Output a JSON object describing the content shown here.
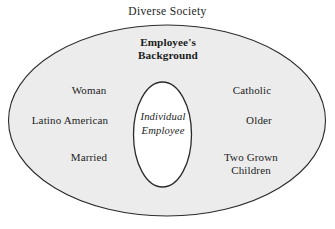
{
  "diagram": {
    "type": "concentric-ellipse-venn",
    "title": "Diverse Society",
    "outer_region": {
      "name": "employees-background",
      "heading": "Employee's\nBackground",
      "fill_color": "#ececec",
      "stroke_color": "#2b2b2b"
    },
    "inner_region": {
      "name": "individual-employee",
      "label": "Individual\nEmployee",
      "fill_color": "#ffffff",
      "stroke_color": "#2b2b2b"
    },
    "background_color": "#ffffff",
    "attributes_left": [
      {
        "id": "woman",
        "text": "Woman"
      },
      {
        "id": "latino-american",
        "text": "Latino American"
      },
      {
        "id": "married",
        "text": "Married"
      }
    ],
    "attributes_right": [
      {
        "id": "catholic",
        "text": "Catholic"
      },
      {
        "id": "older",
        "text": "Older"
      },
      {
        "id": "two-grown-children",
        "text": "Two Grown\nChildren"
      }
    ]
  }
}
